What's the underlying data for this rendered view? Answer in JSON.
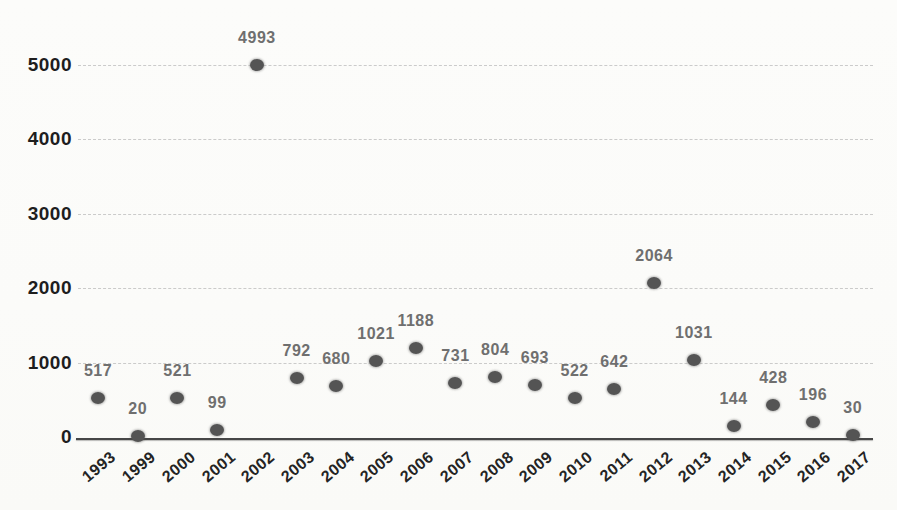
{
  "chart_data": {
    "type": "scatter",
    "title": "",
    "xlabel": "",
    "ylabel": "",
    "categories": [
      "1993",
      "1999",
      "2000",
      "2001",
      "2002",
      "2003",
      "2004",
      "2005",
      "2006",
      "2007",
      "2008",
      "2009",
      "2010",
      "2011",
      "2012",
      "2013",
      "2014",
      "2015",
      "2016",
      "2017"
    ],
    "values": [
      517,
      20,
      521,
      99,
      4993,
      792,
      680,
      1021,
      1188,
      731,
      804,
      693,
      522,
      642,
      2064,
      1031,
      144,
      428,
      196,
      30
    ],
    "yticks": [
      0,
      1000,
      2000,
      3000,
      4000,
      5000
    ],
    "ytick_labels": [
      "0",
      "1000",
      "2000",
      "3000",
      "4000",
      "5000"
    ],
    "ylim": [
      0,
      5000
    ],
    "grid": true,
    "legend": false,
    "data_labels_shown": true
  },
  "colors": {
    "background": "#fbfbf9",
    "point": "#545454",
    "data_label": "#6f6f6f",
    "axis_tick_label": "#1e1e1e",
    "gridline": "#c6c6c6",
    "axis_line": "#474747"
  }
}
